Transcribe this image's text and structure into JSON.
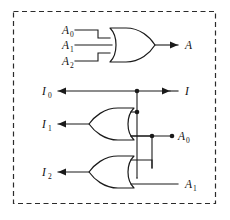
{
  "diagram": {
    "frame": {
      "style": "dashed",
      "color": "#2b2b2b"
    },
    "wire_color": "#1a1a1a",
    "gates": [
      {
        "id": "or-top",
        "type": "OR",
        "orientation": "right",
        "inputs": [
          "A0",
          "A1",
          "A2"
        ],
        "output": "A"
      },
      {
        "id": "or-middle",
        "type": "OR",
        "orientation": "left",
        "inputs": [
          "I-bus",
          "A0-bus"
        ],
        "output": "I1"
      },
      {
        "id": "or-bottom",
        "type": "OR",
        "orientation": "left",
        "inputs": [
          "A0-bus",
          "A1"
        ],
        "output": "I2"
      }
    ],
    "labels": {
      "a0_top": {
        "base": "A",
        "sub": "0"
      },
      "a1_top": {
        "base": "A",
        "sub": "1"
      },
      "a2_top": {
        "base": "A",
        "sub": "2"
      },
      "a_out": {
        "base": "A",
        "sub": ""
      },
      "i0": {
        "base": "I",
        "sub": "0"
      },
      "i_in": {
        "base": "I",
        "sub": ""
      },
      "i1": {
        "base": "I",
        "sub": "1"
      },
      "i2": {
        "base": "I",
        "sub": "2"
      },
      "a0_out": {
        "base": "A",
        "sub": "0"
      },
      "a1_in": {
        "base": "A",
        "sub": "1"
      }
    },
    "junctions": 4
  }
}
